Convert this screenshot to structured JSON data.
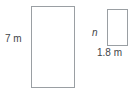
{
  "figure": {
    "type": "geometry-similar-rectangles",
    "problem_number": ".",
    "shapes": [
      {
        "name": "large-rectangle",
        "labels": [
          {
            "name": "height",
            "text": "7 m",
            "value": 7,
            "unit": "m",
            "position": "left"
          }
        ]
      },
      {
        "name": "small-rectangle",
        "labels": [
          {
            "name": "height",
            "text": "n",
            "value": null,
            "unit": "m",
            "position": "left",
            "style": "italic-variable"
          },
          {
            "name": "width",
            "text": "1.8 m",
            "value": 1.8,
            "unit": "m",
            "position": "below"
          }
        ]
      }
    ],
    "colors": {
      "background": "#ffffff",
      "shape_stroke": "#9a9fa3",
      "label_text": "#3f4549",
      "number_text": "#555a5e"
    },
    "large_rectangle_height_label": "7 m",
    "small_rectangle_height_label": "n",
    "small_rectangle_width_label": "1.8 m"
  }
}
